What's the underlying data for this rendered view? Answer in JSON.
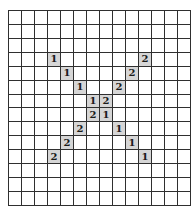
{
  "board": {
    "rows": 14,
    "cols": 14,
    "line_color": "#2f2f2f",
    "clue_bg_color": "#d6d6d6",
    "cells": [
      {
        "row": 3,
        "col": 3,
        "value": "1"
      },
      {
        "row": 4,
        "col": 4,
        "value": "1"
      },
      {
        "row": 5,
        "col": 5,
        "value": "1"
      },
      {
        "row": 6,
        "col": 6,
        "value": "1"
      },
      {
        "row": 7,
        "col": 7,
        "value": "1"
      },
      {
        "row": 8,
        "col": 8,
        "value": "1"
      },
      {
        "row": 9,
        "col": 9,
        "value": "1"
      },
      {
        "row": 10,
        "col": 10,
        "value": "1"
      },
      {
        "row": 3,
        "col": 10,
        "value": "2"
      },
      {
        "row": 4,
        "col": 9,
        "value": "2"
      },
      {
        "row": 5,
        "col": 8,
        "value": "2"
      },
      {
        "row": 6,
        "col": 7,
        "value": "2"
      },
      {
        "row": 7,
        "col": 6,
        "value": "2"
      },
      {
        "row": 8,
        "col": 5,
        "value": "2"
      },
      {
        "row": 9,
        "col": 4,
        "value": "2"
      },
      {
        "row": 10,
        "col": 3,
        "value": "2"
      }
    ]
  }
}
